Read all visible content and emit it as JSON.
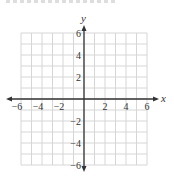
{
  "chart_data": {
    "type": "scatter",
    "title": "",
    "xlabel": "x",
    "ylabel": "y",
    "xlim": [
      -6,
      6
    ],
    "ylim": [
      -6,
      6
    ],
    "grid": true,
    "grid_step": 1,
    "x_ticks": [
      -6,
      -4,
      -2,
      2,
      4,
      6
    ],
    "y_ticks": [
      6,
      4,
      2,
      -2,
      -4,
      -6
    ],
    "x_tick_labels": [
      "−6",
      "−4",
      "−2",
      "2",
      "4",
      "6"
    ],
    "y_tick_labels": [
      "6",
      "4",
      "2",
      "−2",
      "−4",
      "−6"
    ],
    "series": [],
    "colors": {
      "grid": "#d6d6d6",
      "axis": "#333333",
      "background": "#ffffff"
    }
  }
}
